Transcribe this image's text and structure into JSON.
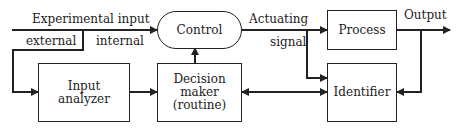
{
  "diagram": {
    "blocks": {
      "control": "Control",
      "input_analyzer_l1": "Input",
      "input_analyzer_l2": "analyzer",
      "decision_l1": "Decision",
      "decision_l2": "maker",
      "decision_l3": "(routine)",
      "process": "Process",
      "identifier": "Identifier"
    },
    "labels": {
      "experimental_input": "Experimental input",
      "external": "external",
      "internal": "internal",
      "actuating": "Actuating",
      "signal": "signal",
      "output": "Output"
    },
    "edges": [
      {
        "from": "Experimental input",
        "to": "Control",
        "label": "internal"
      },
      {
        "from": "Experimental input",
        "to": "Input analyzer",
        "label": "external"
      },
      {
        "from": "Input analyzer",
        "to": "Decision maker"
      },
      {
        "from": "Decision maker",
        "to": "Control"
      },
      {
        "from": "Control",
        "to": "Process",
        "label": "Actuating signal"
      },
      {
        "from": "Control",
        "to": "Identifier"
      },
      {
        "from": "Process",
        "to": "Output"
      },
      {
        "from": "Output",
        "to": "Identifier"
      },
      {
        "from": "Decision maker",
        "to": "Identifier",
        "bidirectional": true
      }
    ]
  }
}
